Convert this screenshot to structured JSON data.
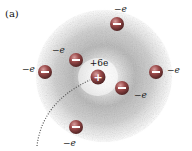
{
  "figure": {
    "panel_label": "(a)",
    "nucleus": {
      "label": "+6e",
      "symbol": "+",
      "cx": 98,
      "cy": 77,
      "r": 7.5
    },
    "electrons": [
      {
        "id": "top",
        "label": "−e",
        "symbol": "−",
        "cx": 117,
        "cy": 24,
        "r": 7,
        "lx": 114,
        "ly": 12
      },
      {
        "id": "upper-left",
        "label": "−e",
        "symbol": "−",
        "cx": 76,
        "cy": 60,
        "r": 7,
        "lx": 52,
        "ly": 53
      },
      {
        "id": "left",
        "label": "−e",
        "symbol": "−",
        "cx": 45,
        "cy": 72,
        "r": 7,
        "lx": 22,
        "ly": 72
      },
      {
        "id": "right",
        "label": "−e",
        "symbol": "−",
        "cx": 156,
        "cy": 72,
        "r": 7,
        "lx": 167,
        "ly": 73
      },
      {
        "id": "right-center",
        "label": "−e",
        "symbol": "−",
        "cx": 122,
        "cy": 88,
        "r": 7,
        "lx": 134,
        "ly": 98
      },
      {
        "id": "bottom",
        "label": "−e",
        "symbol": "−",
        "cx": 76,
        "cy": 127,
        "r": 7,
        "lx": 63,
        "ly": 146
      }
    ],
    "cloud": {
      "cx": 104,
      "cy": 76,
      "r": 70,
      "color": "#9a9a9a"
    },
    "colors": {
      "electron_fill": "#8a4040",
      "electron_highlight": "#c98a8a",
      "nucleus_fill": "#8a3a3a",
      "symbol": "#ffffff",
      "dotted_path": "#555555"
    }
  }
}
